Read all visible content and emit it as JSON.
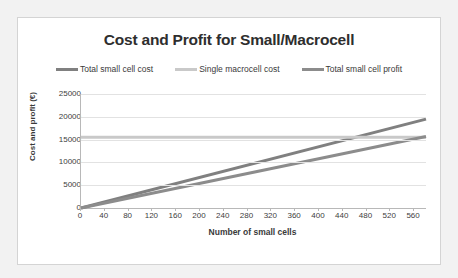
{
  "card": {
    "background": "#ffffff",
    "border_color": "#d4d4d4"
  },
  "page": {
    "background": "#f2f2f2"
  },
  "chart_data": {
    "type": "line",
    "title": "Cost and Profit for Small/Macrocell",
    "xlabel": "Number of small cells",
    "ylabel": "Cost and profit (€)",
    "xlim": [
      0,
      580
    ],
    "ylim": [
      0,
      25000
    ],
    "xticks": [
      0,
      40,
      80,
      120,
      160,
      200,
      240,
      280,
      320,
      360,
      400,
      440,
      480,
      520,
      560
    ],
    "yticks": [
      0,
      5000,
      10000,
      15000,
      20000,
      25000
    ],
    "xtick_labels": [
      "0",
      "40",
      "80",
      "120",
      "160",
      "200",
      "240",
      "280",
      "320",
      "360",
      "400",
      "440",
      "480",
      "520",
      "560"
    ],
    "ytick_labels": [
      "0",
      "5000",
      "10000",
      "15000",
      "20000",
      "25000"
    ],
    "grid": true,
    "grid_axis": "y",
    "legend_position": "top",
    "series": [
      {
        "name": "Total small cell cost",
        "color": "#808080",
        "points": [
          [
            0,
            0
          ],
          [
            580,
            19500
          ]
        ]
      },
      {
        "name": "Single macrocell cost",
        "color": "#c9c9c9",
        "points": [
          [
            0,
            15500
          ],
          [
            580,
            15500
          ]
        ]
      },
      {
        "name": "Total small cell profit",
        "color": "#8c8c8c",
        "points": [
          [
            0,
            0
          ],
          [
            580,
            15700
          ]
        ]
      }
    ]
  }
}
